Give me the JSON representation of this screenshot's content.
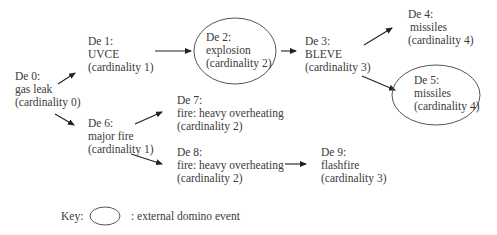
{
  "diagram": {
    "nodes": [
      {
        "id": "De 0",
        "label": "De 0:",
        "event": "gas leak",
        "cardinality": "(cardinality 0)",
        "external": false
      },
      {
        "id": "De 1",
        "label": "De 1:",
        "event": "UVCE",
        "cardinality": "(cardinality 1)",
        "external": false
      },
      {
        "id": "De 2",
        "label": "De 2:",
        "event": "explosion",
        "cardinality": "(cardinality 2)",
        "external": true
      },
      {
        "id": "De 3",
        "label": "De 3:",
        "event": "BLEVE",
        "cardinality": "(cardinality 3)",
        "external": false
      },
      {
        "id": "De 4",
        "label": "De 4:",
        "event": "missiles",
        "cardinality": "(cardinality 4)",
        "external": false
      },
      {
        "id": "De 5",
        "label": "De 5:",
        "event": "missiles",
        "cardinality": "(cardinality 4)",
        "external": true
      },
      {
        "id": "De 6",
        "label": "De 6:",
        "event": "major fire",
        "cardinality": "(cardinality 1)",
        "external": false
      },
      {
        "id": "De 7",
        "label": "De 7:",
        "event": "fire: heavy overheating",
        "cardinality": "(cardinality 2)",
        "external": false
      },
      {
        "id": "De 8",
        "label": "De 8:",
        "event": "fire: heavy overheating",
        "cardinality": "(cardinality 2)",
        "external": false
      },
      {
        "id": "De 9",
        "label": "De 9:",
        "event": "flashfire",
        "cardinality": "(cardinality 3)",
        "external": false
      }
    ],
    "edges": [
      {
        "from": "De 0",
        "to": "De 1"
      },
      {
        "from": "De 0",
        "to": "De 6"
      },
      {
        "from": "De 1",
        "to": "De 2"
      },
      {
        "from": "De 2",
        "to": "De 3"
      },
      {
        "from": "De 3",
        "to": "De 4"
      },
      {
        "from": "De 3",
        "to": "De 5"
      },
      {
        "from": "De 6",
        "to": "De 7"
      },
      {
        "from": "De 6",
        "to": "De 8"
      },
      {
        "from": "De 8",
        "to": "De 9"
      }
    ],
    "key": {
      "label": "Key:",
      "description": ": external domino event"
    }
  }
}
